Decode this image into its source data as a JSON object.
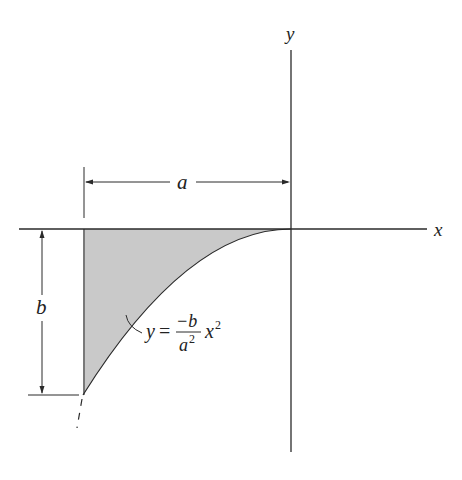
{
  "diagram": {
    "type": "area-under-parabola",
    "labels": {
      "x_axis": "x",
      "y_axis": "y",
      "width_dim": "a",
      "height_dim": "b"
    },
    "equation": {
      "lhs": "y",
      "equals": "=",
      "numerator": "−b",
      "denominator_base": "a",
      "denominator_exp": "2",
      "var": "x",
      "var_exp": "2",
      "text": "y = −b/a² x²"
    },
    "colors": {
      "line": "#2a2a2a",
      "fill": "#c9c9c9",
      "background": "#ffffff"
    }
  }
}
